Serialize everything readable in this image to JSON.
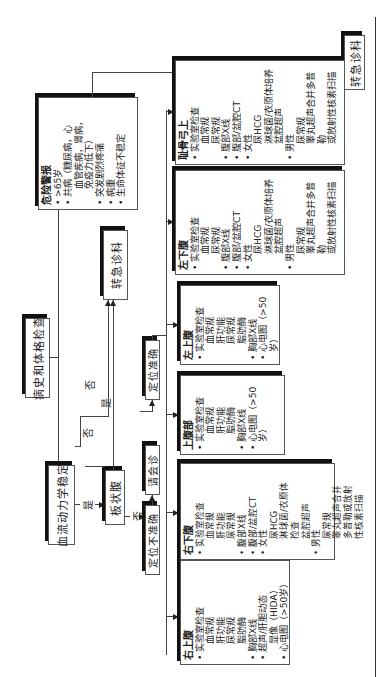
{
  "flowchart": {
    "start": "病史和体格检查",
    "hemodynamic": "血流动力学稳定",
    "abdominal_type": "板状腹",
    "refer_emergency": "转急诊科",
    "localized_accurate": "定位准确",
    "localized_inaccurate": "定位不准确",
    "consult": "请会诊",
    "yes": "是",
    "no": "否",
    "danger": {
      "title": "危险警报",
      "items": [
        {
          "text": ">65岁",
          "bullet": true
        },
        {
          "text": "共病（糖尿病，心",
          "bullet": true
        },
        {
          "text": "血管疾病，肾病，",
          "bullet": false
        },
        {
          "text": "免疫力低下）",
          "bullet": false
        },
        {
          "text": "突发剧烈疼痛",
          "bullet": true
        },
        {
          "text": "病重",
          "bullet": true
        },
        {
          "text": "生命体征不稳定",
          "bullet": true
        }
      ]
    },
    "regions": [
      {
        "title": "右上腹",
        "items": [
          {
            "text": "实验室检查",
            "bullet": true,
            "sub": false
          },
          {
            "text": "血常规",
            "bullet": false,
            "sub": true
          },
          {
            "text": "肝功能",
            "bullet": false,
            "sub": true
          },
          {
            "text": "尿常规",
            "bullet": false,
            "sub": true
          },
          {
            "text": "脂肪酶",
            "bullet": false,
            "sub": true
          },
          {
            "text": "胸部X线",
            "bullet": true,
            "sub": false
          },
          {
            "text": "超声/肝胆动态",
            "bullet": true,
            "sub": false
          },
          {
            "text": "显像（HIDA）",
            "bullet": false,
            "sub": true
          },
          {
            "text": "心电图（>50岁）",
            "bullet": true,
            "sub": false
          }
        ]
      },
      {
        "title": "右下腹",
        "items": [
          {
            "text": "实验室检查",
            "bullet": true,
            "sub": false
          },
          {
            "text": "血常规",
            "bullet": false,
            "sub": true
          },
          {
            "text": "肝功能",
            "bullet": false,
            "sub": true
          },
          {
            "text": "尿常规",
            "bullet": false,
            "sub": true
          },
          {
            "text": "腹部X线",
            "bullet": true,
            "sub": false
          },
          {
            "text": "腹部/盆腔CT",
            "bullet": true,
            "sub": false
          },
          {
            "text": "女性",
            "bullet": true,
            "sub": false
          },
          {
            "text": "尿HCG",
            "bullet": false,
            "sub": true
          },
          {
            "text": "淋球菌/衣原体",
            "bullet": false,
            "sub": true
          },
          {
            "text": "检查",
            "bullet": false,
            "sub": true
          },
          {
            "text": "盆腔超声",
            "bullet": false,
            "sub": true
          },
          {
            "text": "男性",
            "bullet": true,
            "sub": false
          },
          {
            "text": "尿常规",
            "bullet": false,
            "sub": true
          },
          {
            "text": "睾丸超声合并",
            "bullet": false,
            "sub": true
          },
          {
            "text": "多普勒或放射",
            "bullet": false,
            "sub": true
          },
          {
            "text": "性核素扫描",
            "bullet": false,
            "sub": true
          }
        ]
      },
      {
        "title": "上腹部",
        "items": [
          {
            "text": "实验室检查",
            "bullet": true,
            "sub": false
          },
          {
            "text": "血常规",
            "bullet": false,
            "sub": true
          },
          {
            "text": "肝功能",
            "bullet": false,
            "sub": true
          },
          {
            "text": "脂肪酶",
            "bullet": false,
            "sub": true
          },
          {
            "text": "胸部X线",
            "bullet": true,
            "sub": false
          },
          {
            "text": "心电图（>50岁）",
            "bullet": true,
            "sub": false
          }
        ]
      },
      {
        "title": "左上腹",
        "items": [
          {
            "text": "实验室检查",
            "bullet": true,
            "sub": false
          },
          {
            "text": "血常规",
            "bullet": false,
            "sub": true
          },
          {
            "text": "肝功能",
            "bullet": false,
            "sub": true
          },
          {
            "text": "尿常规",
            "bullet": false,
            "sub": true
          },
          {
            "text": "脂肪酶",
            "bullet": false,
            "sub": true
          },
          {
            "text": "胸部X线",
            "bullet": true,
            "sub": false
          },
          {
            "text": "心电图（>50岁）",
            "bullet": true,
            "sub": false
          }
        ]
      },
      {
        "title": "左下腹",
        "items": [
          {
            "text": "实验室检查",
            "bullet": true,
            "sub": false
          },
          {
            "text": "血常规",
            "bullet": false,
            "sub": true
          },
          {
            "text": "尿常规",
            "bullet": false,
            "sub": true
          },
          {
            "text": "腹部X线",
            "bullet": true,
            "sub": false
          },
          {
            "text": "腹部/盆腔CT",
            "bullet": true,
            "sub": false
          },
          {
            "text": "女性",
            "bullet": true,
            "sub": false
          },
          {
            "text": "尿HCG",
            "bullet": false,
            "sub": true
          },
          {
            "text": "淋球菌/衣原体培养",
            "bullet": false,
            "sub": true
          },
          {
            "text": "盆腔超声",
            "bullet": false,
            "sub": true
          },
          {
            "text": "男性",
            "bullet": true,
            "sub": false
          },
          {
            "text": "尿常规",
            "bullet": false,
            "sub": true
          },
          {
            "text": "睾丸超声合并多普勒",
            "bullet": false,
            "sub": true
          },
          {
            "text": "或放射性核素扫描",
            "bullet": false,
            "sub": true
          }
        ]
      },
      {
        "title": "耻骨弓上",
        "items": [
          {
            "text": "实验室检查",
            "bullet": true,
            "sub": false
          },
          {
            "text": "血常规",
            "bullet": false,
            "sub": true
          },
          {
            "text": "尿常规",
            "bullet": false,
            "sub": true
          },
          {
            "text": "腹部X线",
            "bullet": true,
            "sub": false
          },
          {
            "text": "腹部/盆腔CT",
            "bullet": true,
            "sub": false
          },
          {
            "text": "女性",
            "bullet": true,
            "sub": false
          },
          {
            "text": "尿HCG",
            "bullet": false,
            "sub": true
          },
          {
            "text": "淋球菌/衣原体培养",
            "bullet": false,
            "sub": true
          },
          {
            "text": "盆腔超声",
            "bullet": false,
            "sub": true
          },
          {
            "text": "男性",
            "bullet": true,
            "sub": false
          },
          {
            "text": "尿常规",
            "bullet": false,
            "sub": true
          },
          {
            "text": "睾丸超声合并多普勒",
            "bullet": false,
            "sub": true
          },
          {
            "text": "或放射性核素扫描",
            "bullet": false,
            "sub": true
          }
        ]
      }
    ]
  }
}
